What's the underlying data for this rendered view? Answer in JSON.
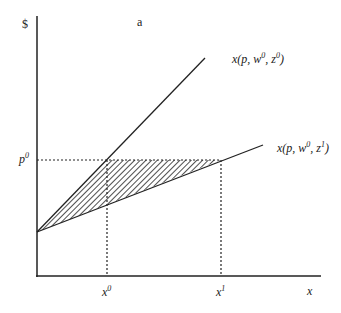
{
  "panel_label": "a",
  "y_axis_label": "$",
  "x_axis_label": "x",
  "price_label": {
    "base": "p",
    "sup": "0"
  },
  "x0_label": {
    "base": "x",
    "sup": "0"
  },
  "x1_label": {
    "base": "x",
    "sup": "1"
  },
  "curve_z0_label": {
    "pre": "x(p, w",
    "w_sup": "0",
    "mid": ", z",
    "z_sup": "0",
    "post": ")"
  },
  "curve_z1_label": {
    "pre": "x(p, w",
    "w_sup": "0",
    "mid": ", z",
    "z_sup": "1",
    "post": ")"
  },
  "colors": {
    "ink": "#222222",
    "background": "#ffffff"
  }
}
